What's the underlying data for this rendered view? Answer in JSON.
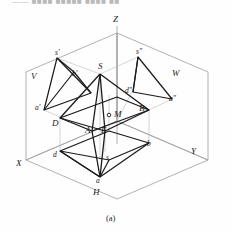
{
  "header": {
    "cut_text": "—— ■■■■ ■■■■■ ■■■■ ■■"
  },
  "figure": {
    "caption": "(a)",
    "axes": {
      "x": "X",
      "y": "Y",
      "z": "Z"
    },
    "planes": {
      "v": "V",
      "h": "H",
      "w": "W"
    },
    "space_points": {
      "apex": "S",
      "a": "A",
      "b": "B",
      "d": "D",
      "e": "E",
      "m": "M"
    },
    "front_view": {
      "s": "s'",
      "a": "a'",
      "b": "b'",
      "d": "d'"
    },
    "top_view": {
      "s": "s",
      "a": "a",
      "b": "b",
      "d": "d"
    },
    "side_view": {
      "s": "s\"",
      "a": "a\"",
      "d": "d\""
    }
  },
  "style": {
    "object_stroke": "#1a1a1a",
    "plane_stroke": "#9b9b9b",
    "thin_stroke": "#b0b0b0",
    "marker_fill": "#ffffff"
  }
}
